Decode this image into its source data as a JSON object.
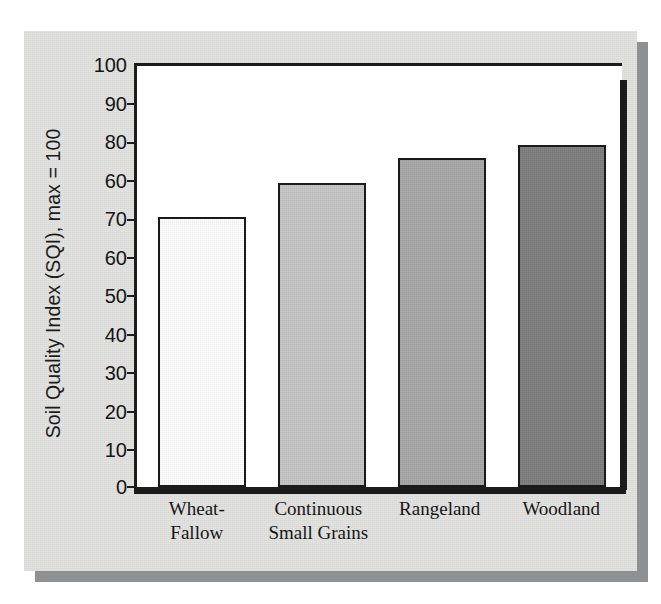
{
  "chart_data": {
    "type": "bar",
    "title": "",
    "xlabel": "",
    "ylabel": "Soil Quality Index (SQI), max = 100",
    "ylim": [
      0,
      100
    ],
    "grid": false,
    "legend": "none",
    "ytick_labels": [
      "100",
      "90",
      "80",
      "60",
      "70",
      "60",
      "50",
      "40",
      "30",
      "20",
      "10",
      "0"
    ],
    "ytick_values": [
      100,
      90,
      80,
      70,
      60,
      50,
      40,
      30,
      20,
      10,
      0
    ],
    "categories": [
      "Wheat-Fallow",
      "Continuous Small Grains",
      "Rangeland",
      "Woodland"
    ],
    "values": [
      64,
      72,
      78,
      81
    ],
    "bars": [
      {
        "label_line1": "Wheat-",
        "label_line2": "Fallow",
        "value": 64,
        "color": "#ffffff"
      },
      {
        "label_line1": "Continuous",
        "label_line2": "Small Grains",
        "value": 72,
        "color": "#c6c6c6"
      },
      {
        "label_line1": "Rangeland",
        "label_line2": "",
        "value": 78,
        "color": "#a8a8a8"
      },
      {
        "label_line1": "Woodland",
        "label_line2": "",
        "value": 81,
        "color": "#7e7e7e"
      }
    ],
    "colors": {
      "axis": "#1b1b1b",
      "plot_background": "#ffffff",
      "paper_background": "#e3e3e1",
      "shadow": "#8f9091",
      "text": "#151515"
    }
  }
}
